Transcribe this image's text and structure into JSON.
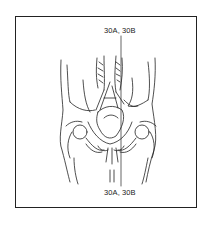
{
  "figure": {
    "labels": {
      "top": "30A, 30B",
      "bottom": "30A, 30B"
    },
    "colors": {
      "line": "#222222",
      "background": "#ffffff"
    }
  }
}
